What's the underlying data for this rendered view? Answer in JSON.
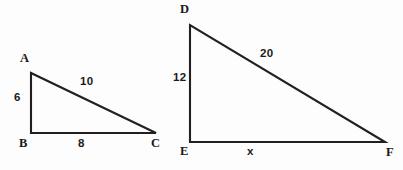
{
  "figure": {
    "background_color": "#fdfdfd",
    "stroke_color": "#231f20",
    "text_color": "#1a1a1a"
  },
  "triangles": [
    {
      "id": "ABC",
      "name": "triangle-abc",
      "vertices": [
        {
          "key": "A",
          "label": "A",
          "x": 31,
          "y": 73
        },
        {
          "key": "B",
          "label": "B",
          "x": 31,
          "y": 133
        },
        {
          "key": "C",
          "label": "C",
          "x": 156,
          "y": 133
        }
      ],
      "sides": [
        {
          "key": "AB",
          "label": "6",
          "known": true,
          "from": "A",
          "to": "B"
        },
        {
          "key": "BC",
          "label": "8",
          "known": true,
          "from": "B",
          "to": "C"
        },
        {
          "key": "AC",
          "label": "10",
          "known": true,
          "from": "A",
          "to": "C"
        }
      ],
      "right_angle_at": "B"
    },
    {
      "id": "DEF",
      "name": "triangle-def",
      "vertices": [
        {
          "key": "D",
          "label": "D",
          "x": 190,
          "y": 25
        },
        {
          "key": "E",
          "label": "E",
          "x": 190,
          "y": 142
        },
        {
          "key": "F",
          "label": "F",
          "x": 385,
          "y": 142
        }
      ],
      "sides": [
        {
          "key": "DE",
          "label": "12",
          "known": true,
          "from": "D",
          "to": "E"
        },
        {
          "key": "EF",
          "label": "x",
          "known": false,
          "from": "E",
          "to": "F"
        },
        {
          "key": "DF",
          "label": "20",
          "known": true,
          "from": "D",
          "to": "F"
        }
      ],
      "right_angle_at": "E"
    }
  ],
  "labels": {
    "A": "A",
    "B": "B",
    "C": "C",
    "D": "D",
    "E": "E",
    "F": "F",
    "AB": "6",
    "BC": "8",
    "AC": "10",
    "DE": "12",
    "EF": "x",
    "DF": "20"
  },
  "paths": {
    "abc": "M 31 73 L 31 133 L 156 133 L 31 73 Z",
    "def": "M 190 25 L 190 142 L 385 142 L 190 25 Z"
  }
}
